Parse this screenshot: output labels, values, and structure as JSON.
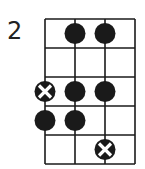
{
  "diagram": {
    "type": "fretboard",
    "start_fret_label": "2",
    "strings": 4,
    "frets": 5,
    "colors": {
      "line": "#1a1a1a",
      "dot": "#1a1a1a",
      "cross": "#ffffff"
    },
    "dots": [
      {
        "fret": 1,
        "string": 2,
        "style": "filled"
      },
      {
        "fret": 1,
        "string": 3,
        "style": "filled"
      },
      {
        "fret": 3,
        "string": 1,
        "style": "root-x"
      },
      {
        "fret": 3,
        "string": 2,
        "style": "filled"
      },
      {
        "fret": 3,
        "string": 3,
        "style": "filled"
      },
      {
        "fret": 4,
        "string": 1,
        "style": "filled"
      },
      {
        "fret": 4,
        "string": 2,
        "style": "filled"
      },
      {
        "fret": 5,
        "string": 3,
        "style": "root-x"
      }
    ]
  }
}
